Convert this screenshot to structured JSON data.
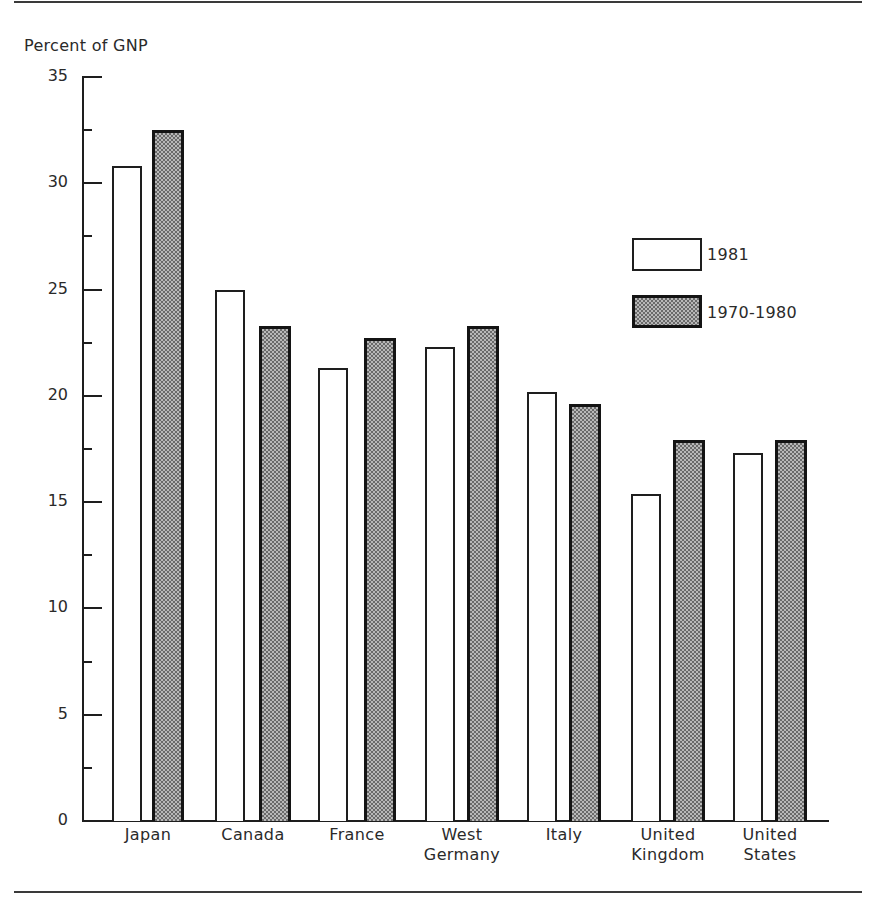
{
  "chart_data": {
    "type": "bar",
    "title": "",
    "ylabel": "Percent of GNP",
    "xlabel": "",
    "ylim": [
      0,
      35
    ],
    "yticks": [
      0,
      5,
      10,
      15,
      20,
      25,
      30,
      35
    ],
    "minor_ticks": [
      2.5,
      7.5,
      12.5,
      17.5,
      22.5,
      27.5,
      32.5
    ],
    "grid": false,
    "legend_position": "upper right (inside plot)",
    "categories": [
      "Japan",
      "Canada",
      "France",
      "West Germany",
      "Italy",
      "United Kingdom",
      "United States"
    ],
    "category_display": [
      [
        "Japan"
      ],
      [
        "Canada"
      ],
      [
        "France"
      ],
      [
        "West",
        "Germany"
      ],
      [
        "Italy"
      ],
      [
        "United",
        "Kingdom"
      ],
      [
        "United",
        "States"
      ]
    ],
    "series": [
      {
        "name": "1981",
        "fill": "white",
        "values": [
          30.8,
          25.0,
          21.3,
          22.3,
          20.2,
          15.4,
          17.3
        ]
      },
      {
        "name": "1970-1980",
        "fill": "gray halftone",
        "values": [
          32.5,
          23.3,
          22.7,
          23.3,
          19.6,
          17.9,
          17.9
        ]
      }
    ]
  },
  "legend": {
    "items": [
      {
        "label": "1981"
      },
      {
        "label": "1970-1980"
      }
    ]
  },
  "colors": {
    "axis": "#1e1e1e",
    "bar_1981": "#ffffff",
    "bar_1970_1980": "#a0a0a0"
  }
}
